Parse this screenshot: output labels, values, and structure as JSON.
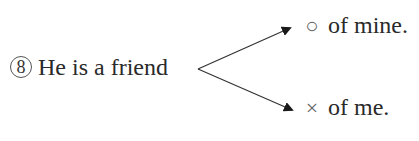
{
  "question": {
    "number": "8",
    "stem": "He is a friend",
    "options": [
      {
        "mark": "○",
        "mark_meaning": "correct",
        "text": "of mine."
      },
      {
        "mark": "×",
        "mark_meaning": "incorrect",
        "text": "of me."
      }
    ]
  }
}
